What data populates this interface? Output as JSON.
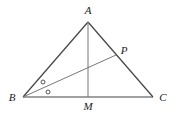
{
  "diagram": {
    "type": "triangle-geometry",
    "points": {
      "A": {
        "label": "A",
        "x": 88,
        "y": 22,
        "label_x": 88,
        "label_y": 14
      },
      "B": {
        "label": "B",
        "x": 23,
        "y": 97,
        "label_x": 12,
        "label_y": 101
      },
      "C": {
        "label": "C",
        "x": 153,
        "y": 97,
        "label_x": 163,
        "label_y": 101
      },
      "M": {
        "label": "M",
        "x": 88,
        "y": 97,
        "label_x": 88,
        "label_y": 110
      },
      "P": {
        "label": "P",
        "x": 116,
        "y": 55,
        "label_x": 124,
        "label_y": 54
      }
    },
    "segments": [
      {
        "from": "A",
        "to": "B",
        "role": "side"
      },
      {
        "from": "A",
        "to": "C",
        "role": "side"
      },
      {
        "from": "B",
        "to": "C",
        "role": "side"
      },
      {
        "from": "A",
        "to": "M",
        "role": "altitude"
      },
      {
        "from": "B",
        "to": "P",
        "role": "angle-bisector"
      }
    ],
    "angle_marks": [
      {
        "vertex": "B",
        "mark": "circle",
        "x": 43,
        "y": 82
      },
      {
        "vertex": "B",
        "mark": "circle",
        "x": 48,
        "y": 92
      }
    ],
    "colors": {
      "side": "#444444",
      "inner_line": "#777777",
      "label": "#222222"
    }
  }
}
